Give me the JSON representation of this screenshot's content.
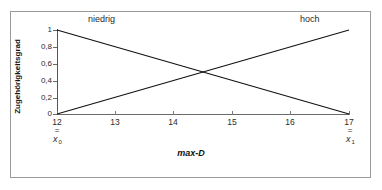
{
  "chart_data": {
    "type": "line",
    "title": "",
    "xlabel": "max-D",
    "ylabel": "Zugehörigkeitsgrad",
    "xlim": [
      12,
      17
    ],
    "ylim": [
      0,
      1
    ],
    "grid": false,
    "legend_position": "inline-annotations",
    "xticks": [
      "12",
      "13",
      "14",
      "15",
      "16",
      "17"
    ],
    "xtick_values": [
      12,
      13,
      14,
      15,
      16,
      17
    ],
    "yticks": [
      "0",
      "0,2",
      "0,4",
      "0,6",
      "0,8",
      "1"
    ],
    "ytick_values": [
      0,
      0.2,
      0.4,
      0.6,
      0.8,
      1
    ],
    "series": [
      {
        "name": "niedrig",
        "x": [
          12,
          17
        ],
        "values": [
          1,
          0
        ],
        "color": "#111111"
      },
      {
        "name": "hoch",
        "x": [
          12,
          17
        ],
        "values": [
          0,
          1
        ],
        "color": "#111111"
      }
    ],
    "annotations": [
      {
        "name": "niedrig",
        "text": "niedrig"
      },
      {
        "name": "hoch",
        "text": "hoch"
      },
      {
        "name": "x0",
        "equals": "=",
        "variable": "x",
        "subscript": "0",
        "at_value": "12"
      },
      {
        "name": "x1",
        "equals": "=",
        "variable": "x",
        "subscript": "1",
        "at_value": "17"
      }
    ],
    "intersection": {
      "x": 14.5,
      "y": 0.5
    }
  },
  "labels": {
    "niedrig": "niedrig",
    "hoch": "hoch",
    "x_axis_title": "max-D",
    "y_axis_title": "Zugehörigkeitsgrad",
    "eq": "=",
    "var_x": "x",
    "sub_0": "0",
    "sub_1": "1"
  },
  "yticks": {
    "t0": "1",
    "t1": "0,8",
    "t2": "0,6",
    "t3": "0,4",
    "t4": "0,2",
    "t5": "0"
  },
  "xticks": {
    "t0": "12",
    "t1": "13",
    "t2": "14",
    "t3": "15",
    "t4": "16",
    "t5": "17"
  },
  "colors": {
    "line": "#111111",
    "axis": "#6a6a6a",
    "frame": "#9a9a9a",
    "text": "#2b2b2b",
    "background": "#ffffff"
  }
}
